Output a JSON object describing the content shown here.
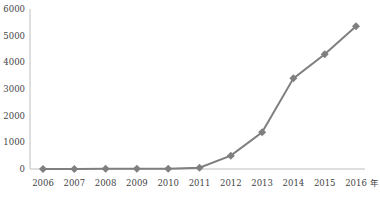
{
  "chart_data": {
    "type": "line",
    "title": "",
    "xlabel": "年",
    "ylabel": "",
    "categories": [
      "2006",
      "2007",
      "2008",
      "2009",
      "2010",
      "2011",
      "2012",
      "2013",
      "2014",
      "2015",
      "2016"
    ],
    "series": [
      {
        "name": "series-1",
        "values": [
          0,
          0,
          5,
          5,
          10,
          50,
          500,
          1380,
          3400,
          4300,
          5350
        ],
        "color": "#7f7f7f",
        "marker": "diamond"
      }
    ],
    "ylim": [
      0,
      6000
    ],
    "yticks": [
      0,
      1000,
      2000,
      3000,
      4000,
      5000,
      6000
    ],
    "grid": false,
    "legend": "none"
  },
  "colors": {
    "line": "#7f7f7f",
    "axis": "#bfbfbf",
    "text": "#444444"
  }
}
